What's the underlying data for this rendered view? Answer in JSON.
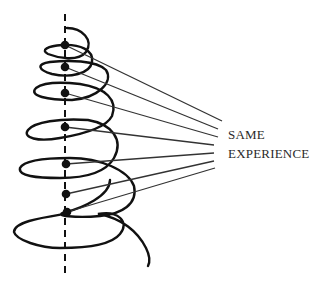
{
  "diagram": {
    "type": "spiral-of-experience",
    "labels": {
      "line1": "SAME",
      "line2": "EXPERIENCE"
    },
    "axis": {
      "style": "dashed",
      "x": 65,
      "y_start": 14,
      "y_end": 278
    },
    "nodes": [
      {
        "x": 65,
        "y": 45
      },
      {
        "x": 65,
        "y": 67
      },
      {
        "x": 65,
        "y": 93
      },
      {
        "x": 65,
        "y": 127
      },
      {
        "x": 66,
        "y": 164
      },
      {
        "x": 66,
        "y": 194
      },
      {
        "x": 67,
        "y": 212
      }
    ],
    "connector_endpoints": [
      {
        "x": 222,
        "y": 121
      },
      {
        "x": 218,
        "y": 129
      },
      {
        "x": 218,
        "y": 137
      },
      {
        "x": 214,
        "y": 145
      },
      {
        "x": 214,
        "y": 153
      },
      {
        "x": 214,
        "y": 161
      },
      {
        "x": 215,
        "y": 168
      }
    ],
    "colors": {
      "stroke": "#111111",
      "connector": "#333333",
      "text": "#2a2a2a"
    }
  }
}
